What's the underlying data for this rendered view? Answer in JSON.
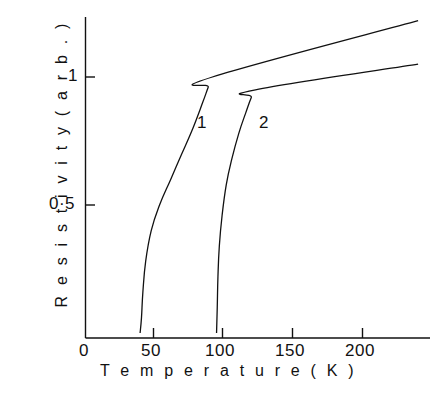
{
  "chart_data": {
    "type": "line",
    "title": "",
    "xlabel": "Temperature     (K)",
    "ylabel": "Resistivity  (arb.)",
    "xlabel_text": "Temperature",
    "xlabel_unit": "(K)",
    "ylabel_text": "Resistivity",
    "ylabel_unit": "(arb.)",
    "xlim": [
      0,
      240
    ],
    "ylim": [
      0,
      1.3
    ],
    "grid": false,
    "legend": "inline-curve-labels",
    "xticks": [
      0,
      50,
      100,
      150,
      200
    ],
    "xtick_labels": [
      "0",
      "50",
      "100",
      "150",
      "200"
    ],
    "yticks": [
      0,
      0.5,
      1
    ],
    "ytick_labels": [
      "0",
      "0·5",
      "1"
    ],
    "ytick_labels_drawn": [
      "0·5",
      "1"
    ],
    "annotations": [
      {
        "text": "1",
        "x": 82,
        "y": 0.84
      },
      {
        "text": "2",
        "x": 127,
        "y": 0.84
      }
    ],
    "series": [
      {
        "name": "1",
        "label": "1",
        "color": "#111111",
        "transition_onset_K": 40,
        "transition_midpoint_K": 45,
        "knee_K": 92,
        "knee_value": 1.0,
        "end_K": 240,
        "end_value": 1.22,
        "points": [
          [
            40,
            0.0
          ],
          [
            41,
            0.06
          ],
          [
            42,
            0.16
          ],
          [
            44,
            0.28
          ],
          [
            48,
            0.4
          ],
          [
            54,
            0.5
          ],
          [
            62,
            0.6
          ],
          [
            70,
            0.7
          ],
          [
            78,
            0.8
          ],
          [
            85,
            0.9
          ],
          [
            89,
            0.96
          ],
          [
            92,
            1.0
          ],
          [
            240,
            1.22
          ]
        ]
      },
      {
        "name": "2",
        "label": "2",
        "color": "#111111",
        "transition_onset_K": 95,
        "transition_midpoint_K": 100,
        "knee_K": 123,
        "knee_value": 0.95,
        "end_K": 240,
        "end_value": 1.05,
        "points": [
          [
            95,
            0.0
          ],
          [
            95.5,
            0.1
          ],
          [
            96,
            0.22
          ],
          [
            97,
            0.34
          ],
          [
            99,
            0.46
          ],
          [
            102,
            0.58
          ],
          [
            106,
            0.68
          ],
          [
            111,
            0.78
          ],
          [
            116,
            0.86
          ],
          [
            120,
            0.92
          ],
          [
            123,
            0.95
          ],
          [
            240,
            1.05
          ]
        ]
      }
    ]
  },
  "axes": {
    "x_tick_0": "0",
    "x_tick_50": "50",
    "x_tick_100": "100",
    "x_tick_150": "150",
    "x_tick_200": "200",
    "y_tick_1": "1",
    "y_tick_05": "0·5",
    "y_origin": "0",
    "x_title": "T e m p e r a t u r e      ( K )",
    "y_title": "R e s i s t i v i t y   ( a r b . )"
  },
  "curve_labels": {
    "one": "1",
    "two": "2"
  },
  "colors": {
    "ink": "#111111",
    "background": "#ffffff"
  }
}
